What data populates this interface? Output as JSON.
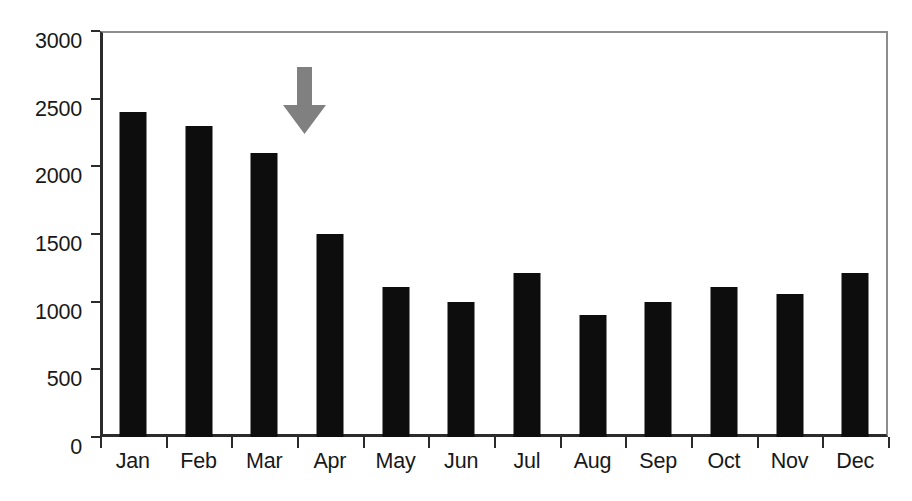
{
  "figure": {
    "background_color": "#ffffff",
    "bar_color": "#0d0d0d",
    "axis_color": "#2b2b2b",
    "frame_color": "#8d8d8d",
    "annotation_color": "#808080"
  },
  "annotation": {
    "type": "down-arrow",
    "icon": "arrow-down-icon",
    "color": "#808080",
    "points_at_category": "Apr"
  },
  "caption": {
    "text": ""
  },
  "chart_data": {
    "type": "bar",
    "title": "",
    "subtitle": "",
    "xlabel": "",
    "ylabel": "",
    "categories": [
      "Jan",
      "Feb",
      "Mar",
      "Apr",
      "May",
      "Jun",
      "Jul",
      "Aug",
      "Sep",
      "Oct",
      "Nov",
      "Dec"
    ],
    "values": [
      2400,
      2300,
      2100,
      1500,
      1110,
      1000,
      1210,
      900,
      1000,
      1110,
      1060,
      1210
    ],
    "series": [
      {
        "name": "",
        "values": [
          2400,
          2300,
          2100,
          1500,
          1110,
          1000,
          1210,
          900,
          1000,
          1110,
          1060,
          1210
        ],
        "color": "#0d0d0d"
      }
    ],
    "ylim": [
      0,
      3000
    ],
    "yticks": [
      0,
      500,
      1000,
      1500,
      2000,
      2500,
      3000
    ],
    "ytick_labels": [
      "0",
      "500",
      "1000",
      "1500",
      "2000",
      "2500",
      "3000"
    ],
    "grid": false,
    "legend": false,
    "legend_position": "none",
    "annotations": [
      {
        "kind": "arrow",
        "direction": "down",
        "at_category": "Apr",
        "color": "#808080"
      }
    ]
  }
}
